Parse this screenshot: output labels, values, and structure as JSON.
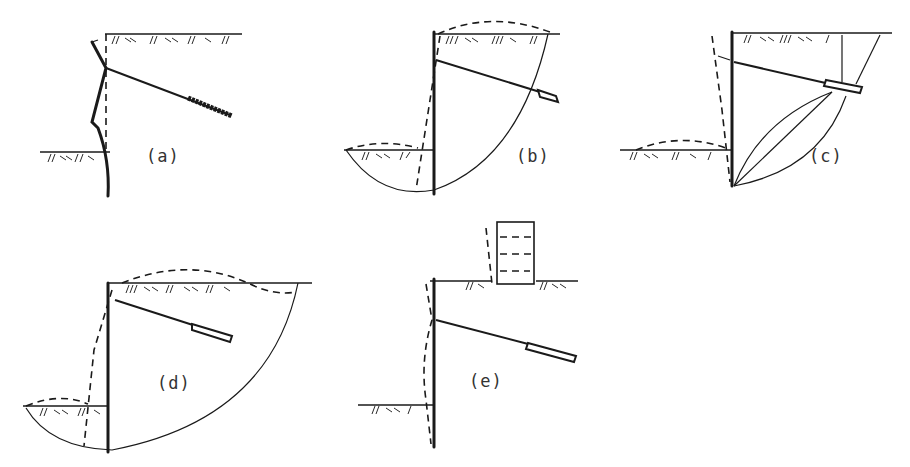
{
  "figure": {
    "panels": [
      {
        "id": "a",
        "label": "(a)",
        "mode": "wall bending / anchor pull-out near head"
      },
      {
        "id": "b",
        "label": "(b)",
        "mode": "deep-seated rotational failure passing beyond anchor"
      },
      {
        "id": "c",
        "label": "(c)",
        "mode": "toe kick-out with failure wedge through anchor zone"
      },
      {
        "id": "d",
        "label": "(d)",
        "mode": "overall deep slip surface enclosing anchor"
      },
      {
        "id": "e",
        "label": "(e)",
        "mode": "wall deflection with adjacent building settlement"
      }
    ],
    "colors": {
      "ink": "#1a1a1a",
      "background": "#ffffff"
    }
  }
}
